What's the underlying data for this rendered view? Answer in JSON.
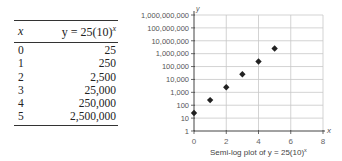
{
  "table": {
    "headers": {
      "x": "x",
      "y_prefix": "y = 25(10)",
      "y_sup": "x"
    },
    "rows": [
      {
        "x": "0",
        "y": "25"
      },
      {
        "x": "1",
        "y": "250"
      },
      {
        "x": "2",
        "y": "2,500"
      },
      {
        "x": "3",
        "y": "25,000"
      },
      {
        "x": "4",
        "y": "250,000"
      },
      {
        "x": "5",
        "y": "2,500,000"
      }
    ]
  },
  "chart_data": {
    "type": "scatter",
    "caption_prefix": "Semi-log plot of ",
    "caption_formula": "y = 25(10)",
    "caption_sup": "x",
    "xlabel": "x",
    "ylabel": "y",
    "yscale": "log",
    "xlim": [
      0,
      8
    ],
    "ylim": [
      1,
      1000000000
    ],
    "x_ticks": [
      "0",
      "2",
      "4",
      "6",
      "8"
    ],
    "y_ticks": [
      "1",
      "10",
      "100",
      "1,000",
      "10,000",
      "100,000",
      "1,000,000",
      "10,000,000",
      "100,000,000",
      "1,000,000,000"
    ],
    "grid": true,
    "x": [
      0,
      1,
      2,
      3,
      4,
      5
    ],
    "values": [
      25,
      250,
      2500,
      25000,
      250000,
      2500000
    ],
    "marker": "diamond",
    "colors": {
      "marker": "#222222",
      "grid": "#c8c8c8",
      "axis": "#444444"
    }
  }
}
